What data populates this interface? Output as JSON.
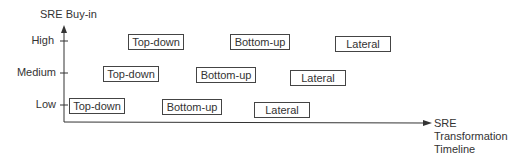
{
  "y_axis": {
    "title": "SRE Buy-in",
    "ticks": [
      "High",
      "Medium",
      "Low"
    ]
  },
  "x_axis": {
    "title_lines": [
      "SRE",
      "Transformation",
      "Timeline"
    ]
  },
  "rows": [
    {
      "level": "High",
      "items": [
        "Top-down",
        "Bottom-up",
        "Lateral"
      ]
    },
    {
      "level": "Medium",
      "items": [
        "Top-down",
        "Bottom-up",
        "Lateral"
      ]
    },
    {
      "level": "Low",
      "items": [
        "Top-down",
        "Bottom-up",
        "Lateral"
      ]
    }
  ]
}
